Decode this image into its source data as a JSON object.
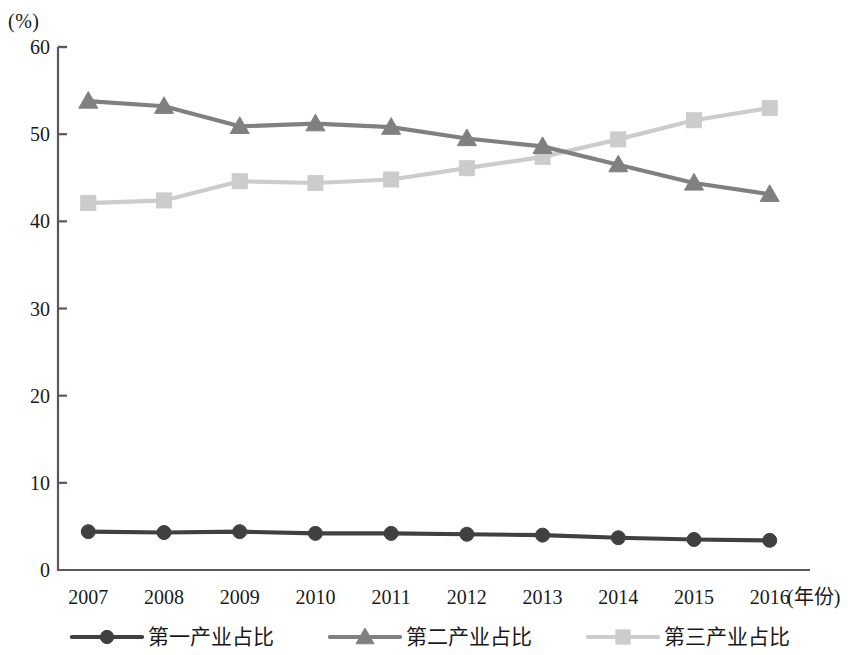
{
  "chart_data": {
    "type": "line",
    "title": "",
    "subtitle": "",
    "xlabel": "(年份)",
    "ylabel": "(%)",
    "categories": [
      "2007",
      "2008",
      "2009",
      "2010",
      "2011",
      "2012",
      "2013",
      "2014",
      "2015",
      "2016"
    ],
    "x": [
      2007,
      2008,
      2009,
      2010,
      2011,
      2012,
      2013,
      2014,
      2015,
      2016
    ],
    "xlim": [
      2006.6,
      2016.4
    ],
    "ylim": [
      0,
      60
    ],
    "yticks": [
      0,
      10,
      20,
      30,
      40,
      50,
      60
    ],
    "grid": false,
    "legend_position": "bottom",
    "series": [
      {
        "name": "第一产业占比",
        "marker": "circle",
        "color": "#404040",
        "values": [
          4.4,
          4.3,
          4.4,
          4.2,
          4.2,
          4.1,
          4.0,
          3.7,
          3.5,
          3.4
        ]
      },
      {
        "name": "第二产业占比",
        "marker": "triangle",
        "color": "#808080",
        "values": [
          53.8,
          53.2,
          50.9,
          51.2,
          50.8,
          49.5,
          48.6,
          46.5,
          44.4,
          43.1
        ]
      },
      {
        "name": "第三产业占比",
        "marker": "square",
        "color": "#cccccc",
        "values": [
          42.1,
          42.4,
          44.6,
          44.4,
          44.8,
          46.1,
          47.4,
          49.4,
          51.6,
          53.0
        ]
      }
    ]
  },
  "axes": {
    "y_unit_label": "(%)",
    "x_axis_title": "(年份)",
    "axis_color": "#595959"
  },
  "legend": {
    "items": [
      {
        "label": "第一产业占比",
        "color": "#404040",
        "marker": "circle"
      },
      {
        "label": "第二产业占比",
        "color": "#808080",
        "marker": "triangle"
      },
      {
        "label": "第三产业占比",
        "color": "#cccccc",
        "marker": "square"
      }
    ]
  }
}
